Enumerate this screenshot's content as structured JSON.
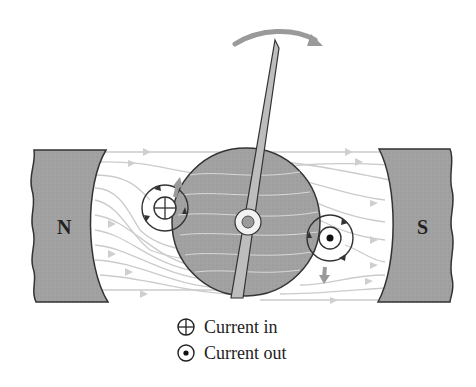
{
  "diagram": {
    "type": "moving-coil galvanometer / motor principle",
    "poles": {
      "north_label": "N",
      "south_label": "S"
    },
    "colors": {
      "pole_fill": "#9e9e9e",
      "rotor_fill": "#a9a9a9",
      "field_line": "#c8c8c8",
      "arrow_gray": "#9a9a9a",
      "outline": "#333333"
    },
    "rotation_arrow": "clockwise",
    "conductors": [
      {
        "position": "left",
        "symbol": "current-in"
      },
      {
        "position": "right",
        "symbol": "current-out"
      }
    ]
  },
  "legend": {
    "items": [
      {
        "symbol": "current-in-icon",
        "label": "Current in"
      },
      {
        "symbol": "current-out-icon",
        "label": "Current out"
      }
    ]
  }
}
